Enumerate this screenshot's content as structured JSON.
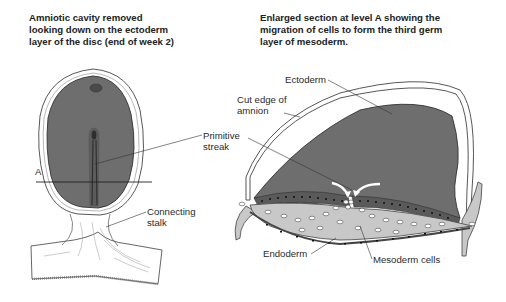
{
  "left_panel": {
    "title_lines": [
      "Amniotic cavity removed",
      "looking down on the ectoderm",
      "layer of the disc (end of week 2)"
    ],
    "labels": {
      "section_marker": "A",
      "primitive_streak_line1": "Primitive",
      "primitive_streak_line2": "streak",
      "connecting_stalk_line1": "Connecting",
      "connecting_stalk_line2": "stalk"
    }
  },
  "right_panel": {
    "title_lines": [
      "Enlarged section at level A showing the",
      "migration of cells to form the third germ",
      "layer of mesoderm."
    ],
    "labels": {
      "ectoderm": "Ectoderm",
      "cut_edge_line1": "Cut edge of",
      "cut_edge_line2": "amnion",
      "endoderm": "Endoderm",
      "mesoderm_cells": "Mesoderm cells"
    }
  },
  "colors": {
    "disc_fill": "#6e6e6e",
    "mesoderm_fill": "#c8c8c8",
    "outline": "#333333",
    "text": "#222222"
  }
}
